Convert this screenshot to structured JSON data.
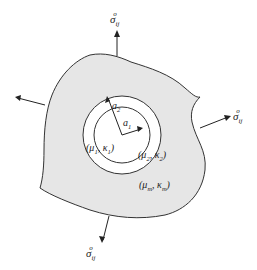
{
  "diagram": {
    "colors": {
      "matrix_fill": "#e6e6e6",
      "inclusion_fill": "#ffffff",
      "stroke": "#333333"
    },
    "stress_label": {
      "symbol": "σ",
      "sub": "ij",
      "sup": "o"
    },
    "radii": {
      "a1": {
        "symbol": "a",
        "sub": "1"
      },
      "a2": {
        "symbol": "a",
        "sub": "2"
      }
    },
    "phases": {
      "core": {
        "mu": "μ",
        "mu_sub": "1",
        "kappa": "κ",
        "kappa_sub": "1"
      },
      "shell": {
        "mu": "μ",
        "mu_sub": "2",
        "kappa": "κ",
        "kappa_sub": "2"
      },
      "matrix": {
        "mu": "μ",
        "mu_sub": "m",
        "kappa": "κ",
        "kappa_sub": "m"
      }
    }
  }
}
